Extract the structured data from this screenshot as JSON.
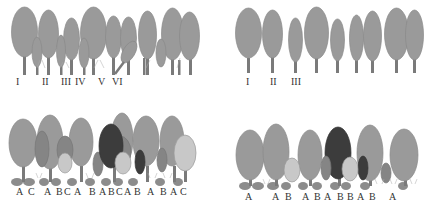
{
  "panels": [
    {
      "id": "top-left",
      "description": "Uneven-aged stand with multiple layers",
      "labels": [
        {
          "text": "I",
          "x": 16,
          "y": 77
        },
        {
          "text": "II",
          "x": 42,
          "y": 77
        },
        {
          "text": "III",
          "x": 62,
          "y": 77
        },
        {
          "text": "IV",
          "x": 76,
          "y": 77
        },
        {
          "text": "V",
          "x": 98,
          "y": 77
        },
        {
          "text": "VI",
          "x": 113,
          "y": 77
        }
      ]
    },
    {
      "id": "top-right",
      "description": "Even-aged single-layer stand",
      "labels": [
        {
          "text": "I",
          "x": 246,
          "y": 77
        },
        {
          "text": "II",
          "x": 270,
          "y": 77
        },
        {
          "text": "III",
          "x": 292,
          "y": 77
        }
      ]
    },
    {
      "id": "bottom-left",
      "description": "Mixed stand of species A, B, C",
      "label_string": "A C  A  BC A  B A BCA B  A  B A C",
      "labels": [
        {
          "text": "A",
          "x": 16
        },
        {
          "text": "C",
          "x": 28
        },
        {
          "text": "A",
          "x": 44
        },
        {
          "text": "B",
          "x": 56
        },
        {
          "text": "C",
          "x": 64
        },
        {
          "text": "A",
          "x": 74
        },
        {
          "text": "B",
          "x": 89
        },
        {
          "text": "A",
          "x": 99
        },
        {
          "text": "B",
          "x": 108
        },
        {
          "text": "C",
          "x": 116
        },
        {
          "text": "A",
          "x": 124
        },
        {
          "text": "B",
          "x": 134
        },
        {
          "text": "A",
          "x": 147
        },
        {
          "text": "B",
          "x": 160
        },
        {
          "text": "A",
          "x": 170
        },
        {
          "text": "C",
          "x": 180
        }
      ]
    },
    {
      "id": "bottom-right",
      "description": "Mixed stand of species A and B",
      "labels": [
        {
          "text": "A",
          "x": 245
        },
        {
          "text": "A",
          "x": 272
        },
        {
          "text": "B",
          "x": 285
        },
        {
          "text": "A",
          "x": 302
        },
        {
          "text": "B",
          "x": 314
        },
        {
          "text": "A",
          "x": 324
        },
        {
          "text": "B",
          "x": 337
        },
        {
          "text": "B",
          "x": 347
        },
        {
          "text": "A",
          "x": 357
        },
        {
          "text": "B",
          "x": 369
        },
        {
          "text": "A",
          "x": 389
        }
      ]
    }
  ],
  "colors": {
    "crown_gray": "#9a9a9a",
    "crown_outline": "#8a8a8a",
    "trunk": "#7a7a7a",
    "dark_crown": "#3c3c3c",
    "light_crown": "#c8c8c8",
    "medium_crown": "#858585",
    "shrub": "#8c8c8c",
    "text": "#333333"
  }
}
